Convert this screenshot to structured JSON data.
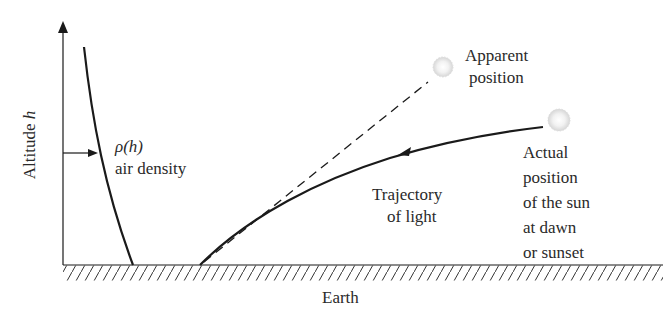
{
  "diagram": {
    "type": "physics-schematic",
    "topic": "Atmospheric refraction of sunlight at dawn or sunset",
    "y_axis_label": "Altitude",
    "y_axis_var": "h",
    "density_label_symbol": "ρ(h)",
    "density_label_text": "air density",
    "apparent_label_line1": "Apparent",
    "apparent_label_line2": "position",
    "trajectory_label_line1": "Trajectory",
    "trajectory_label_line2": "of light",
    "actual_label_lines": [
      "Actual",
      "position",
      "of the sun",
      "at dawn",
      "or sunset"
    ],
    "ground_label": "Earth",
    "colors": {
      "line": "#1a1a1a",
      "sun": "#d8d8d8",
      "text": "#2a2a2a"
    }
  }
}
